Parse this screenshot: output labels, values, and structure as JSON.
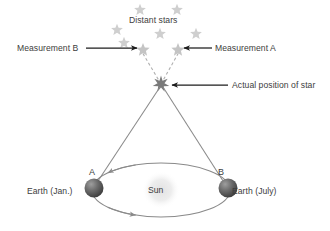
{
  "figure": {
    "labels": {
      "distant_stars": "Distant stars",
      "measurement_b": "Measurement B",
      "measurement_a": "Measurement A",
      "actual_position": "Actual position of star",
      "earth_january": "Earth (Jan.)",
      "earth_july": "Earth (July)",
      "sun": "Sun",
      "point_a": "A",
      "point_b": "B"
    },
    "colors": {
      "background": "#ffffff",
      "text": "#3d3d3d",
      "faint_star": "#cfcfcf",
      "actual_star": "#7a7a7a",
      "sight_line": "#8a8a8a",
      "dashed_line": "#b0b0b0",
      "arrow": "#1c1c1c",
      "orbit": "#8a8a8a",
      "earth_dark": "#4a4a4a",
      "earth_light": "#9a9a9a",
      "sun_glow": "#ededed"
    },
    "background_stars": [
      {
        "cx": 117,
        "cy": 30,
        "r": 6.2
      },
      {
        "cx": 140,
        "cy": 10,
        "r": 6.2
      },
      {
        "cx": 177,
        "cy": 10,
        "r": 6.2
      },
      {
        "cx": 124,
        "cy": 43,
        "r": 6.2
      },
      {
        "cx": 160,
        "cy": 34,
        "r": 6.2
      },
      {
        "cx": 196,
        "cy": 34,
        "r": 6.2
      }
    ],
    "measurement_stars": [
      {
        "id": "measurement-b-star",
        "cx": 143,
        "cy": 50,
        "r": 7.0
      },
      {
        "id": "measurement-a-star",
        "cx": 178,
        "cy": 50,
        "r": 7.0
      }
    ],
    "actual_star": {
      "cx": 161,
      "cy": 84,
      "r": 8.5
    },
    "dashed_sightlines": [
      {
        "id": "dashed-to-measurement-b",
        "x1": 161,
        "y1": 84,
        "x2": 142,
        "y2": 52
      },
      {
        "id": "dashed-to-measurement-a",
        "x1": 161,
        "y1": 84,
        "x2": 179,
        "y2": 52
      }
    ],
    "solid_sightlines": [
      {
        "id": "sightline-earth-jan-to-star",
        "x1": 96,
        "y1": 184,
        "x2": 160,
        "y2": 87
      },
      {
        "id": "sightline-earth-jul-to-star",
        "x1": 225,
        "y1": 184,
        "x2": 163,
        "y2": 87
      }
    ],
    "arrows": [
      {
        "id": "arrow-measurement-b",
        "x1": 86,
        "y1": 48,
        "x2": 137,
        "y2": 48
      },
      {
        "id": "arrow-measurement-a",
        "x1": 212,
        "y1": 48,
        "x2": 184,
        "y2": 48
      },
      {
        "id": "arrow-actual-position",
        "x1": 228,
        "y1": 85,
        "x2": 172,
        "y2": 85
      }
    ],
    "orbit": {
      "cx": 161,
      "cy": 190,
      "rx": 69,
      "ry": 27,
      "direction_arrow_top": {
        "x": 118,
        "y": 173.5,
        "points_to": "left"
      },
      "direction_arrow_bottom": {
        "x": 184,
        "y": 216.5,
        "points_to": "right"
      }
    },
    "sun": {
      "cx": 161,
      "cy": 190,
      "r": 19
    },
    "earths": [
      {
        "id": "earth-january",
        "cx": 94,
        "cy": 188,
        "r": 9.5
      },
      {
        "id": "earth-july",
        "cx": 228,
        "cy": 188,
        "r": 9.5
      }
    ]
  }
}
